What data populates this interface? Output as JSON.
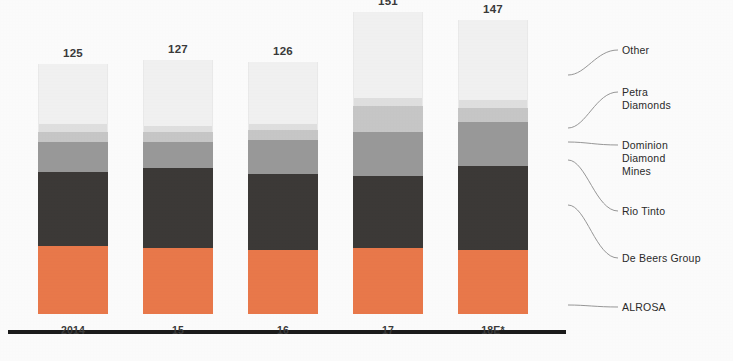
{
  "chart_data": {
    "type": "bar",
    "subtype": "stacked-bar",
    "title": "",
    "xlabel": "",
    "ylabel": "",
    "categories": [
      "2014",
      "15",
      "16",
      "17",
      "18E*"
    ],
    "totals": [
      125,
      127,
      126,
      151,
      147
    ],
    "ylim": [
      0,
      151
    ],
    "grid": false,
    "legend_position": "right",
    "stack_order_bottom_to_top": [
      "ALROSA",
      "De Beers Group",
      "Rio Tinto",
      "Dominion Diamond Mines",
      "Petra Diamonds",
      "Other"
    ],
    "series": [
      {
        "name": "ALROSA",
        "color": "#ec7a4c",
        "values": [
          34,
          33,
          32,
          33,
          32
        ]
      },
      {
        "name": "De Beers Group",
        "color": "#3d3a38",
        "values": [
          37,
          40,
          38,
          36,
          42
        ]
      },
      {
        "name": "Rio Tinto",
        "color": "#9b9b9b",
        "values": [
          15,
          13,
          17,
          22,
          22
        ]
      },
      {
        "name": "Dominion Diamond Mines",
        "color": "#c9c9c9",
        "values": [
          5,
          5,
          5,
          13,
          7
        ]
      },
      {
        "name": "Petra Diamonds",
        "color": "#e2e2e2",
        "values": [
          4,
          3,
          3,
          4,
          4
        ]
      },
      {
        "name": "Other",
        "color": "#f4f4f4",
        "values": [
          30,
          33,
          31,
          43,
          40
        ]
      }
    ]
  },
  "legend": {
    "items": [
      {
        "label": "Other"
      },
      {
        "label": "Petra\nDiamonds"
      },
      {
        "label": "Dominion\nDiamond\nMines"
      },
      {
        "label": "Rio Tinto"
      },
      {
        "label": "De Beers Group"
      },
      {
        "label": "ALROSA"
      }
    ]
  },
  "colors": {
    "alrosa": "#ec7a4c",
    "de_beers": "#3d3a38",
    "rio_tinto": "#9b9b9b",
    "dominion": "#c9c9c9",
    "petra": "#e2e2e2",
    "other": "#f4f4f4",
    "axis": "#1c1c1c",
    "text": "#2b2b2b",
    "leader": "#8d8d8d"
  }
}
